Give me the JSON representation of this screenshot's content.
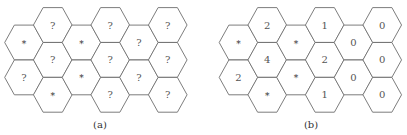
{
  "panels": [
    {
      "label": "(a)",
      "columns": [
        [
          "*",
          "?"
        ],
        [
          "?",
          "?",
          "*"
        ],
        [
          "*",
          "*"
        ],
        [
          "?",
          "?",
          "?"
        ],
        [
          "?",
          "?"
        ],
        [
          "?",
          "?",
          "?"
        ]
      ]
    },
    {
      "label": "(b)",
      "columns": [
        [
          "*",
          "2"
        ],
        [
          "2",
          "4",
          "*"
        ],
        [
          "*",
          "*"
        ],
        [
          "1",
          "2",
          "1"
        ],
        [
          "0",
          "0"
        ],
        [
          "0",
          "0",
          "0"
        ]
      ]
    }
  ],
  "colors": {
    "stroke": "#6e6e6e",
    "text": "#555555",
    "background": "#ffffff"
  }
}
